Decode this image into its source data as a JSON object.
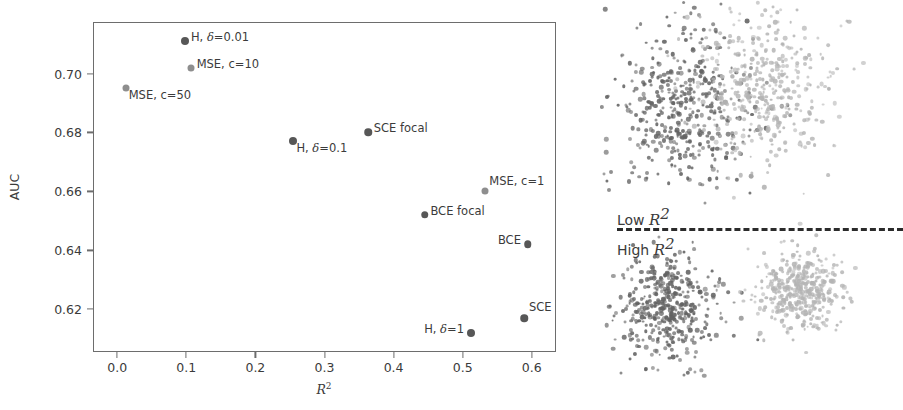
{
  "chart_data": [
    {
      "type": "scatter",
      "id": "auc-vs-r2",
      "title": "",
      "xlabel": "R²",
      "ylabel": "AUC",
      "xlim": [
        -0.035,
        0.635
      ],
      "ylim": [
        0.6055,
        0.7175
      ],
      "xticks": [
        "0.0",
        "0.1",
        "0.2",
        "0.3",
        "0.4",
        "0.5",
        "0.6"
      ],
      "xtick_values": [
        0.0,
        0.1,
        0.2,
        0.3,
        0.4,
        0.5,
        0.6
      ],
      "yticks": [
        "0.70",
        "0.68",
        "0.66",
        "0.64",
        "0.62"
      ],
      "ytick_values": [
        0.7,
        0.68,
        0.66,
        0.64,
        0.62
      ],
      "grid": false,
      "legend": "none",
      "points": [
        {
          "label": "H, δ=0.01",
          "label_parts": {
            "pre": "H, ",
            "mi": "δ",
            "post": "=0.01"
          },
          "x": 0.098,
          "y": 0.711,
          "shade": "dark",
          "size": 8.0,
          "label_pos": "right"
        },
        {
          "label": "MSE, c=10",
          "label_parts": {
            "pre": "MSE, c=10",
            "mi": "",
            "post": ""
          },
          "x": 0.107,
          "y": 0.702,
          "shade": "light",
          "size": 7.0,
          "label_pos": "right"
        },
        {
          "label": "MSE, c=50",
          "label_parts": {
            "pre": "MSE, c=50",
            "mi": "",
            "post": ""
          },
          "x": 0.013,
          "y": 0.695,
          "shade": "light",
          "size": 7.0,
          "label_pos": "below-right"
        },
        {
          "label": "SCE focal",
          "label_parts": {
            "pre": "SCE focal",
            "mi": "",
            "post": ""
          },
          "x": 0.363,
          "y": 0.68,
          "shade": "dark",
          "size": 7.5,
          "label_pos": "right"
        },
        {
          "label": "H, δ=0.1",
          "label_parts": {
            "pre": "H, ",
            "mi": "δ",
            "post": "=0.1"
          },
          "x": 0.255,
          "y": 0.677,
          "shade": "dark",
          "size": 8.0,
          "label_pos": "below-right"
        },
        {
          "label": "MSE, c=1",
          "label_parts": {
            "pre": "MSE, c=1",
            "mi": "",
            "post": ""
          },
          "x": 0.532,
          "y": 0.66,
          "shade": "light",
          "size": 7.0,
          "label_pos": "above-right"
        },
        {
          "label": "BCE focal",
          "label_parts": {
            "pre": "BCE focal",
            "mi": "",
            "post": ""
          },
          "x": 0.445,
          "y": 0.652,
          "shade": "dark",
          "size": 7.5,
          "label_pos": "right"
        },
        {
          "label": "BCE",
          "label_parts": {
            "pre": "BCE",
            "mi": "",
            "post": ""
          },
          "x": 0.594,
          "y": 0.642,
          "shade": "dark",
          "size": 7.5,
          "label_pos": "left"
        },
        {
          "label": "SCE",
          "label_parts": {
            "pre": "SCE",
            "mi": "",
            "post": ""
          },
          "x": 0.589,
          "y": 0.617,
          "shade": "dark",
          "size": 7.5,
          "label_pos": "above"
        },
        {
          "label": "H, δ=1",
          "label_parts": {
            "pre": "H, ",
            "mi": "δ",
            "post": "=1"
          },
          "x": 0.512,
          "y": 0.612,
          "shade": "dark",
          "size": 8.0,
          "label_pos": "left"
        }
      ],
      "colors": {
        "dark": "#575757",
        "light": "#8e8e8e",
        "axis": "#6d6d6d",
        "text": "#3b3b3b"
      }
    },
    {
      "type": "scatter",
      "id": "cluster-illustration",
      "title": "",
      "xlabel": "",
      "ylabel": "",
      "grid": false,
      "legend": "none",
      "divider": {
        "low_label": "Low R²",
        "high_label": "High R²",
        "style": "dashed"
      },
      "panels": [
        {
          "name": "low-r2",
          "caption": "Low R²",
          "description": "two heavily overlapping point clouds",
          "clusters": [
            {
              "name": "class-a",
              "shade": "dark",
              "center": [
                85,
                105
              ],
              "spread": [
                34,
                40
              ],
              "n": 430
            },
            {
              "name": "class-b",
              "shade": "light",
              "center": [
                168,
                88
              ],
              "spread": [
                34,
                40
              ],
              "n": 400
            }
          ]
        },
        {
          "name": "high-r2",
          "caption": "High R²",
          "description": "two well separated point clouds",
          "clusters": [
            {
              "name": "class-a",
              "shade": "dark",
              "center": [
                66,
                307
              ],
              "spread": [
                26,
                26
              ],
              "n": 430
            },
            {
              "name": "class-b",
              "shade": "light",
              "center": [
                200,
                290
              ],
              "spread": [
                21,
                20
              ],
              "n": 400
            }
          ]
        }
      ],
      "colors": {
        "dark": "#636363",
        "light": "#b4b4b4"
      }
    }
  ],
  "left_panel": {
    "axis": {
      "ylabel": "AUC",
      "xlabel_pre": "R",
      "xlabel_sup": "2",
      "yticks": [
        "0.70",
        "0.68",
        "0.66",
        "0.64",
        "0.62"
      ],
      "xticks": [
        "0.0",
        "0.1",
        "0.2",
        "0.3",
        "0.4",
        "0.5",
        "0.6"
      ]
    }
  },
  "right_panel": {
    "low_label": {
      "pre": "Low ",
      "mi": "R",
      "sup": "2"
    },
    "high_label": {
      "pre": "High ",
      "mi": "R",
      "sup": "2"
    }
  }
}
